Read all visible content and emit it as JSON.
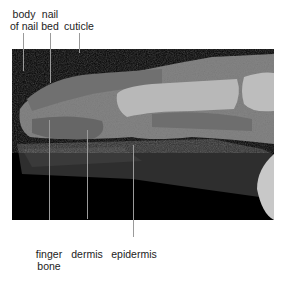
{
  "figure": {
    "top_labels": [
      {
        "line1": "body",
        "line2": "of nail",
        "x": 23
      },
      {
        "line1": "nail",
        "line2": "bed",
        "x": 50
      },
      {
        "line1": "cuticle",
        "line2": "",
        "x": 79
      }
    ],
    "bottom_labels": [
      {
        "line1": "finger",
        "line2": "bone",
        "x": 49
      },
      {
        "line1": "dermis",
        "line2": "",
        "x": 87
      },
      {
        "line1": "epidermis",
        "line2": "",
        "x": 133
      }
    ],
    "colors": {
      "background": "#ffffff",
      "photo_bg": "#000000",
      "leader": "#9a9a9a",
      "tissue": "#8c8c8c"
    }
  }
}
